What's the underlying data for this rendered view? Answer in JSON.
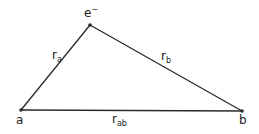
{
  "diagram": {
    "type": "triangle-geometry",
    "colors": {
      "line": "#2a2a2a",
      "text": "#222222",
      "background": "#ffffff"
    },
    "points": {
      "a": {
        "label": "a",
        "x": 21,
        "y": 110
      },
      "e": {
        "label": "e",
        "superscript": "−",
        "x": 90,
        "y": 25
      },
      "b": {
        "label": "b",
        "x": 242,
        "y": 111
      }
    },
    "edges": [
      {
        "from": "a",
        "to": "e",
        "label": "r",
        "subscript": "a"
      },
      {
        "from": "e",
        "to": "b",
        "label": "r",
        "subscript": "b"
      },
      {
        "from": "a",
        "to": "b",
        "label": "r",
        "subscript": "ab"
      }
    ]
  }
}
